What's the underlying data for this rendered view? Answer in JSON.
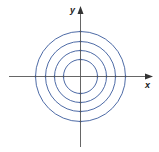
{
  "diagram": {
    "title": "",
    "axes": {
      "x_label": "x",
      "y_label": "y",
      "color": "#555555"
    },
    "circles": {
      "color": "#3a5a9c",
      "center": [
        80.5,
        76.5
      ],
      "radii_px": [
        17,
        26,
        35,
        45
      ]
    }
  }
}
